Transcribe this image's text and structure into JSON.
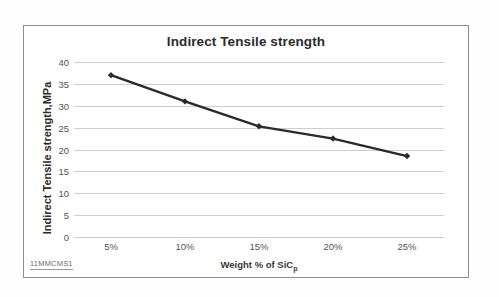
{
  "caption": "11MMCMS1",
  "chart_data": {
    "type": "line",
    "title": "Indirect Tensile strength",
    "xlabel": "Weight % of SiC",
    "xlabel_subscript": "p",
    "ylabel": "Indirect Tensile  strength,MPa",
    "categories": [
      "5%",
      "10%",
      "15%",
      "20%",
      "25%"
    ],
    "values": [
      37,
      31,
      25.3,
      22.5,
      18.5
    ],
    "series": [
      {
        "name": "Indirect Tensile strength",
        "values": [
          37,
          31,
          25.3,
          22.5,
          18.5
        ],
        "color": "#2a2a2a",
        "marker": "diamond"
      }
    ],
    "yticks": [
      40,
      35,
      30,
      25,
      20,
      15,
      10,
      5,
      0
    ],
    "ylim": [
      0,
      40
    ],
    "grid": true,
    "grid_color": "#cfcfcf",
    "legend": false,
    "legend_position": "none",
    "background": "#ffffff",
    "frame_color": "#8d8d8d"
  }
}
